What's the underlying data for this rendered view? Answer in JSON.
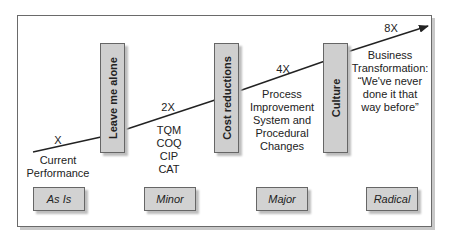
{
  "diagram": {
    "stages": [
      {
        "id": "as-is",
        "label": "As Is",
        "multiplier": "X",
        "description": [
          "Current",
          "Performance"
        ]
      },
      {
        "id": "minor",
        "label": "Minor",
        "barrier": "Leave me alone",
        "multiplier": "2X",
        "description": [
          "TQM",
          "COQ",
          "CIP",
          "CAT"
        ]
      },
      {
        "id": "major",
        "label": "Major",
        "barrier": "Cost reductions",
        "multiplier": "4X",
        "description": [
          "Process",
          "Improvement",
          "System and",
          "Procedural",
          "Changes"
        ]
      },
      {
        "id": "radical",
        "label": "Radical",
        "barrier": "Culture",
        "multiplier": "8X",
        "description": [
          "Business",
          "Transformation:",
          "“We've never",
          "done it that",
          "way before”"
        ]
      }
    ],
    "colors": {
      "box_fill": "#cfcfcf",
      "box_border": "#666666",
      "line": "#222222",
      "frame_border": "#6a6a6a"
    },
    "arrow_icon": "arrow-right-icon"
  }
}
